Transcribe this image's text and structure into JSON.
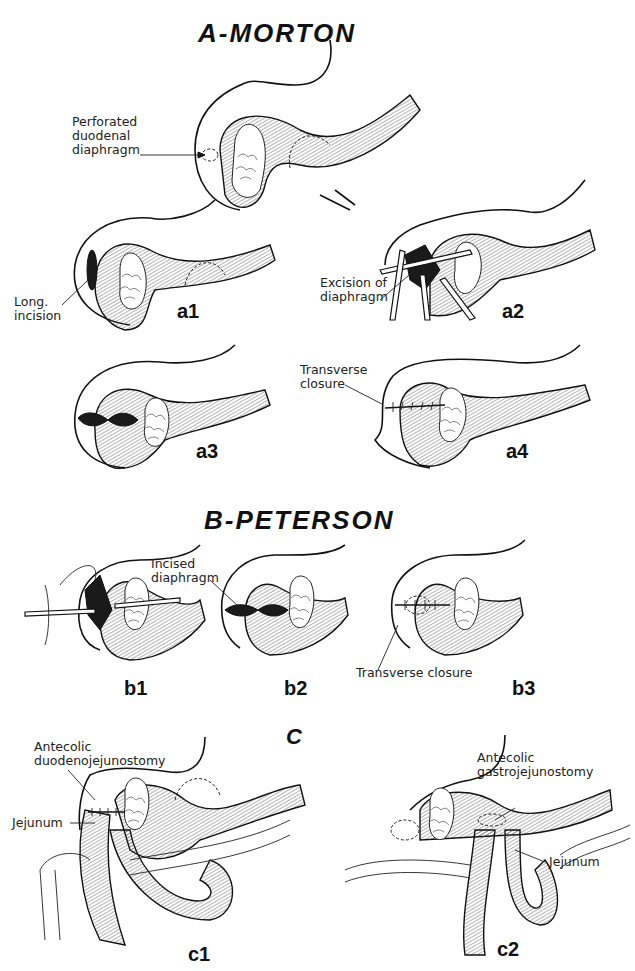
{
  "figure": {
    "sections": [
      {
        "id": "A",
        "title": "A-MORTON",
        "panels": [
          {
            "id": "a0",
            "label": "",
            "annotations": [
              "Perforated\nduodenal\ndiaphragm"
            ]
          },
          {
            "id": "a1",
            "label": "a1",
            "annotations": [
              "Long.\nincision"
            ]
          },
          {
            "id": "a2",
            "label": "a2",
            "annotations": [
              "Excision of\ndiaphragm"
            ]
          },
          {
            "id": "a3",
            "label": "a3",
            "annotations": []
          },
          {
            "id": "a4",
            "label": "a4",
            "annotations": [
              "Transverse\nclosure"
            ]
          }
        ]
      },
      {
        "id": "B",
        "title": "B-PETERSON",
        "panels": [
          {
            "id": "b1",
            "label": "b1",
            "annotations": []
          },
          {
            "id": "b2",
            "label": "b2",
            "annotations": [
              "Incised\ndiaphragm"
            ]
          },
          {
            "id": "b3",
            "label": "b3",
            "annotations": [
              "Transverse closure"
            ]
          }
        ]
      },
      {
        "id": "C",
        "title": "C",
        "panels": [
          {
            "id": "c1",
            "label": "c1",
            "annotations": [
              "Antecolic\nduodenojejunostomy",
              "Jejunum"
            ]
          },
          {
            "id": "c2",
            "label": "c2",
            "annotations": [
              "Antecolic\ngastrojejunostomy",
              "Jejunum"
            ]
          }
        ]
      }
    ]
  }
}
